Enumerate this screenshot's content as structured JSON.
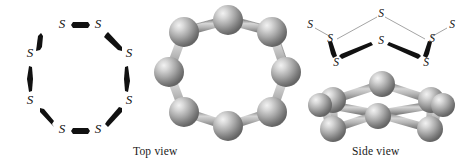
{
  "figure": {
    "background_color": "#ffffff",
    "width": 462,
    "height": 164
  },
  "captions": {
    "top_view": "Top view",
    "side_view": "Side view"
  },
  "atom_symbol": "S",
  "colors": {
    "bond_dark": "#111111",
    "bond_light": "#8c8c8c",
    "sphere_base": "#9a9a9a",
    "sphere_highlight": "#e8e8e8",
    "sphere_shadow": "#5d5d5d",
    "stick_light": "#c9c9c9",
    "stick_edge": "#7d7d7d",
    "text": "#111111"
  },
  "panels": {
    "skeletal_top": {
      "name": "skeletal-octagon-top-view",
      "atom_count": 8,
      "labels": [
        "S",
        "S",
        "S",
        "S",
        "S",
        "S",
        "S",
        "S"
      ],
      "atoms": [
        {
          "id": "s1",
          "label": "S",
          "x": 62,
          "y": 28
        },
        {
          "id": "s2",
          "label": "S",
          "x": 98,
          "y": 28
        },
        {
          "id": "s3",
          "label": "S",
          "x": 127,
          "y": 57
        },
        {
          "id": "s4",
          "label": "S",
          "x": 127,
          "y": 100
        },
        {
          "id": "s5",
          "label": "S",
          "x": 98,
          "y": 128
        },
        {
          "id": "s6",
          "label": "S",
          "x": 62,
          "y": 128
        },
        {
          "id": "s7",
          "label": "S",
          "x": 32,
          "y": 100
        },
        {
          "id": "s8",
          "label": "S",
          "x": 32,
          "y": 57
        }
      ],
      "bonds": [
        {
          "from": "s1",
          "to": "s2"
        },
        {
          "from": "s2",
          "to": "s3"
        },
        {
          "from": "s3",
          "to": "s4"
        },
        {
          "from": "s4",
          "to": "s5"
        },
        {
          "from": "s5",
          "to": "s6"
        },
        {
          "from": "s6",
          "to": "s7"
        },
        {
          "from": "s7",
          "to": "s8"
        },
        {
          "from": "s8",
          "to": "s1"
        }
      ]
    },
    "ballstick_top": {
      "name": "ball-and-stick-ring-top-view",
      "atom_count": 8,
      "ring_radius": 57,
      "sphere_radius": 15
    },
    "skeletal_side": {
      "name": "skeletal-crown-side-view",
      "atom_count": 8,
      "labels": [
        "S",
        "S",
        "S",
        "S",
        "S",
        "S",
        "S",
        "S"
      ],
      "atoms": [
        {
          "id": "t1",
          "label": "S",
          "x": 381,
          "y": 14,
          "depth": "back"
        },
        {
          "id": "t2",
          "label": "S",
          "x": 330,
          "y": 38,
          "depth": "back"
        },
        {
          "id": "t3",
          "label": "S",
          "x": 432,
          "y": 38,
          "depth": "back"
        },
        {
          "id": "t4",
          "label": "S",
          "x": 310,
          "y": 24,
          "depth": "back"
        },
        {
          "id": "t5",
          "label": "S",
          "x": 452,
          "y": 24,
          "depth": "back"
        },
        {
          "id": "t6",
          "label": "S",
          "x": 381,
          "y": 41,
          "depth": "front"
        },
        {
          "id": "t7",
          "label": "S",
          "x": 325,
          "y": 62,
          "depth": "front"
        },
        {
          "id": "t8",
          "label": "S",
          "x": 437,
          "y": 62,
          "depth": "front"
        }
      ]
    },
    "ballstick_side": {
      "name": "ball-and-stick-crown-side-view",
      "atom_count": 8,
      "sphere_radius": 13
    }
  }
}
